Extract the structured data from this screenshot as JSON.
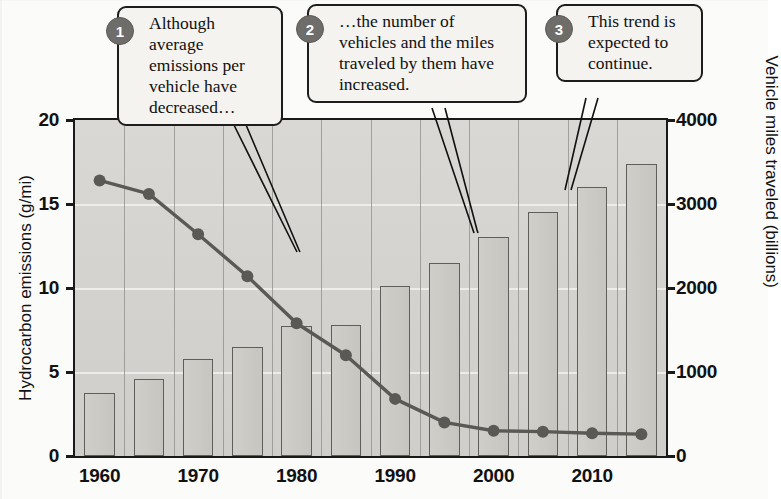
{
  "chart_data": {
    "type": "bar",
    "title": "",
    "xlabel": "",
    "ylabel": "Hydrocarbon emissions (g/mi)",
    "y2label": "Vehicle miles traveled (billions)",
    "x": [
      1960,
      1965,
      1970,
      1975,
      1980,
      1985,
      1990,
      1995,
      2000,
      2005,
      2010,
      2015
    ],
    "xtick_labels": [
      "1960",
      "1970",
      "1980",
      "1990",
      "2000",
      "2010"
    ],
    "xtick_values": [
      1960,
      1970,
      1980,
      1990,
      2000,
      2010
    ],
    "ylim": [
      0,
      20
    ],
    "ytick_labels": [
      "0",
      "5",
      "10",
      "15",
      "20"
    ],
    "ytick_values": [
      0,
      5,
      10,
      15,
      20
    ],
    "y2lim": [
      0,
      4000
    ],
    "y2tick_labels": [
      "0",
      "1000",
      "2000",
      "3000",
      "4000"
    ],
    "y2tick_values": [
      0,
      1000,
      2000,
      3000,
      4000
    ],
    "grid": true,
    "legend": "none",
    "series": [
      {
        "name": "Vehicle miles traveled (billions)",
        "type": "bar",
        "axis": "right",
        "color": "#cbcac5",
        "edge_color": "#5f5e5b",
        "values": [
          750,
          920,
          1150,
          1300,
          1550,
          1560,
          2020,
          2300,
          2610,
          2900,
          3200,
          3480
        ]
      },
      {
        "name": "Hydrocarbon emissions (g/mi)",
        "type": "line",
        "axis": "left",
        "color": "#5a5955",
        "marker": "circle",
        "values": [
          16.4,
          15.6,
          13.2,
          10.7,
          7.9,
          6.0,
          3.4,
          2.0,
          1.5,
          1.45,
          1.35,
          1.3
        ]
      }
    ]
  },
  "callouts": [
    {
      "number": "1",
      "text": "Although average emissions per vehicle have decreased…"
    },
    {
      "number": "2",
      "text": "…the number of vehicles and the miles traveled by them have increased."
    },
    {
      "number": "3",
      "text": "This trend is expected to continue."
    }
  ],
  "colors": {
    "plot_background": "#d5d4d0",
    "bar_fill": "#cbcac5",
    "bar_edge": "#5f5e5b",
    "line": "#5a5955",
    "badge": "#6e6d6a",
    "axis": "#1a1a1a",
    "gridline": "#f2f1ee",
    "callout_fill": "#f4f3f0"
  }
}
